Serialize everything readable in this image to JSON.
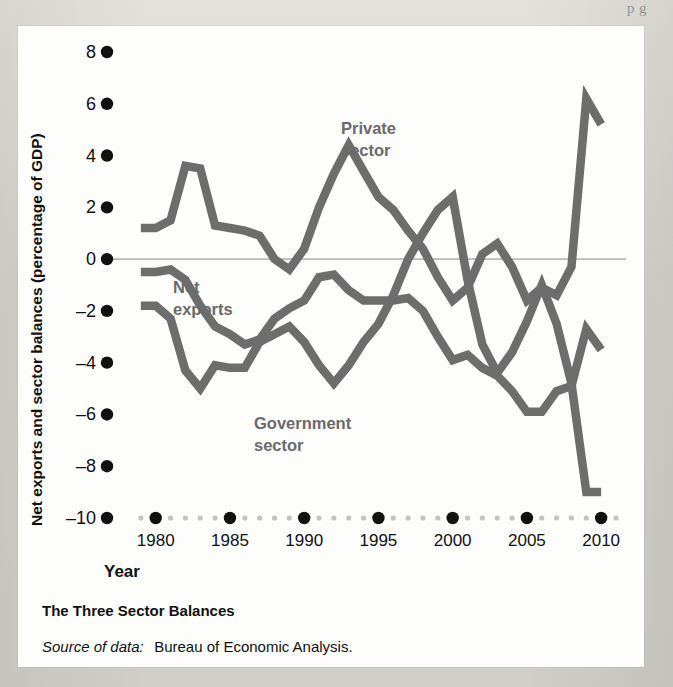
{
  "page": {
    "top_running_text": "p     g",
    "background_color": "#d8d7d2",
    "card_color": "#fdfdfc"
  },
  "caption": {
    "title": "The Three Sector Balances",
    "source_prefix": "Source of data:",
    "source_text": "Bureau of Economic Analysis."
  },
  "chart_data": {
    "type": "line",
    "title": "The Three Sector Balances",
    "xlabel": "Year",
    "ylabel": "Net exports and sector balances (percentage of GDP)",
    "xlim": [
      1978,
      2011
    ],
    "ylim": [
      -10,
      8
    ],
    "grid": false,
    "legend": "inline-annotations",
    "zero_line": true,
    "line_color": "#6d6d6d",
    "x_major_ticks": [
      1980,
      1985,
      1990,
      1995,
      2000,
      2005,
      2010
    ],
    "y_ticks": [
      8,
      6,
      4,
      2,
      0,
      -2,
      -4,
      -6,
      -8,
      -10
    ],
    "x": [
      1979,
      1980,
      1981,
      1982,
      1983,
      1984,
      1985,
      1986,
      1987,
      1988,
      1989,
      1990,
      1991,
      1992,
      1993,
      1994,
      1995,
      1996,
      1997,
      1998,
      1999,
      2000,
      2001,
      2002,
      2003,
      2004,
      2005,
      2006,
      2007,
      2008,
      2009,
      2010
    ],
    "series": [
      {
        "name": "Private sector",
        "label": "Private\nsector",
        "label_line1": "Private",
        "label_line2": "sector",
        "values": [
          1.2,
          1.2,
          1.5,
          3.6,
          3.5,
          1.3,
          1.2,
          1.1,
          0.9,
          0.0,
          -0.4,
          0.4,
          2.0,
          3.3,
          4.4,
          3.4,
          2.4,
          1.9,
          1.1,
          0.4,
          -0.7,
          -1.6,
          -1.1,
          0.2,
          0.6,
          -0.3,
          -1.6,
          -1.1,
          -1.4,
          -0.3,
          6.2,
          5.2
        ]
      },
      {
        "name": "Net exports",
        "label": "Net\nexports",
        "label_line1": "Net",
        "label_line2": "exports",
        "values": [
          -0.5,
          -0.5,
          -0.4,
          -0.8,
          -1.8,
          -2.6,
          -2.9,
          -3.3,
          -3.1,
          -2.3,
          -1.9,
          -1.6,
          -0.7,
          -0.6,
          -1.2,
          -1.6,
          -1.6,
          -1.6,
          -1.5,
          -2.0,
          -3.0,
          -3.9,
          -3.7,
          -4.2,
          -4.5,
          -5.1,
          -5.9,
          -5.9,
          -5.1,
          -4.9,
          -2.7,
          -3.5
        ]
      },
      {
        "name": "Government sector",
        "label": "Government\nsector",
        "label_line1": "Government",
        "label_line2": "sector",
        "values": [
          -1.8,
          -1.8,
          -2.3,
          -4.3,
          -5.0,
          -4.1,
          -4.2,
          -4.2,
          -3.2,
          -2.9,
          -2.6,
          -3.2,
          -4.1,
          -4.8,
          -4.1,
          -3.2,
          -2.5,
          -1.4,
          0.0,
          1.0,
          1.9,
          2.4,
          -0.8,
          -3.3,
          -4.4,
          -3.6,
          -2.4,
          -1.0,
          -2.5,
          -4.8,
          -9.0,
          -9.0
        ]
      }
    ]
  },
  "axes": {
    "x_title": "Year",
    "y_title": "Net exports and sector balances (percentage of GDP)"
  }
}
